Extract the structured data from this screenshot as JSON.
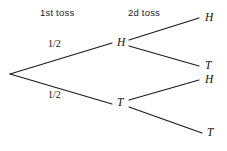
{
  "diagram": {
    "type": "probability-tree",
    "title": "",
    "background_color": "#ffffff",
    "line_color": "#1a1a1a",
    "text_color": "#111111",
    "headers": [
      {
        "label": "1st toss",
        "x": 40,
        "y": 8
      },
      {
        "label": "2d toss",
        "x": 128,
        "y": 8
      }
    ],
    "nodes": [
      {
        "id": "root",
        "label": "",
        "x": 10,
        "y": 74
      },
      {
        "id": "h1",
        "label": "H",
        "x": 120,
        "y": 43
      },
      {
        "id": "t1",
        "label": "T",
        "x": 120,
        "y": 103
      },
      {
        "id": "h1h2",
        "label": "H",
        "x": 206,
        "y": 18
      },
      {
        "id": "h1t2",
        "label": "T",
        "x": 206,
        "y": 66
      },
      {
        "id": "t1h2",
        "label": "H",
        "x": 206,
        "y": 80
      },
      {
        "id": "t1t2",
        "label": "T",
        "x": 209,
        "y": 133
      }
    ],
    "edges": [
      {
        "from": "root",
        "to": "h1",
        "label": "1/2",
        "label_x": 52,
        "label_y": 44
      },
      {
        "from": "root",
        "to": "t1",
        "label": "1/2",
        "label_x": 52,
        "label_y": 94
      },
      {
        "from": "h1",
        "to": "h1h2",
        "label": ""
      },
      {
        "from": "h1",
        "to": "h1t2",
        "label": ""
      },
      {
        "from": "t1",
        "to": "t1h2",
        "label": ""
      },
      {
        "from": "t1",
        "to": "t1t2",
        "label": ""
      }
    ]
  }
}
